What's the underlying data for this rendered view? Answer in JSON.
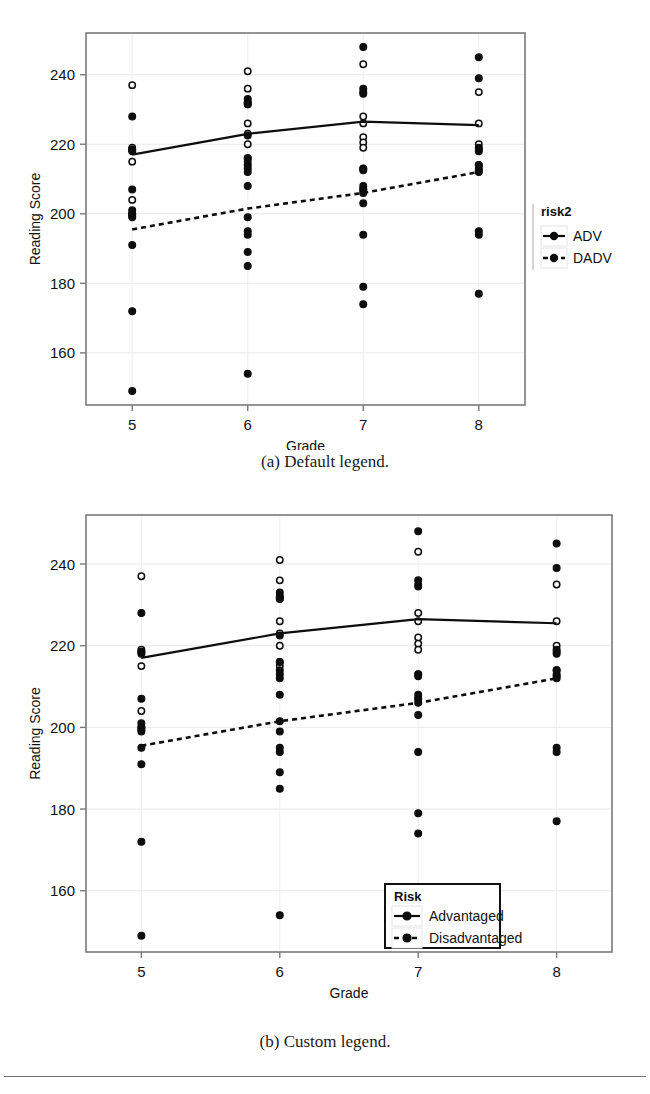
{
  "page": {
    "figure_a_caption": "(a) Default legend.",
    "figure_b_caption": "(b) Custom legend."
  },
  "chart_data": [
    {
      "id": "default-legend",
      "type": "scatter",
      "title": "",
      "xlabel": "Grade",
      "ylabel": "Reading Score",
      "xlim": [
        4.6,
        8.4
      ],
      "ylim": [
        145,
        252
      ],
      "xticks": [
        5,
        6,
        7,
        8
      ],
      "xticklabels": [
        "5",
        "6",
        "7",
        "8"
      ],
      "yticks": [
        160,
        180,
        200,
        220,
        240
      ],
      "yticklabels": [
        "160",
        "180",
        "200",
        "220",
        "240"
      ],
      "grid": true,
      "legend": {
        "title": "risk2",
        "position": "right",
        "boxed": false,
        "entries": [
          {
            "label": "ADV",
            "marker": "filled-circle",
            "line": "solid"
          },
          {
            "label": "DADV",
            "marker": "filled-circle",
            "line": "dotted"
          }
        ]
      },
      "series": [
        {
          "name": "ADV",
          "marker": "open-circle",
          "line": "solid",
          "trend": {
            "x": [
              5,
              6,
              7,
              8
            ],
            "y": [
              217.0,
              223.0,
              226.5,
              225.5
            ]
          },
          "points": {
            "5": [
              237,
              219,
              218.5,
              215,
              204,
              200
            ],
            "6": [
              241,
              236,
              232,
              231.5,
              226,
              223,
              220,
              216,
              215
            ],
            "7": [
              243,
              235,
              228,
              226,
              222,
              220.5,
              219,
              213,
              207
            ],
            "8": [
              235,
              226,
              220,
              218.5,
              214
            ]
          }
        },
        {
          "name": "DADV",
          "marker": "filled-circle",
          "line": "dotted",
          "trend": {
            "x": [
              5,
              6,
              7,
              8
            ],
            "y": [
              195.5,
              201.5,
              206.0,
              212.0
            ]
          },
          "points": {
            "5": [
              228,
              218.5,
              218,
              207,
              201,
              200,
              199.5,
              199,
              191,
              172,
              149
            ],
            "6": [
              233,
              232,
              231.5,
              222.5,
              216,
              214,
              213,
              212,
              208,
              199,
              195,
              194,
              189,
              185,
              154
            ],
            "7": [
              248,
              236,
              234.5,
              213,
              212.5,
              208,
              207,
              206,
              203,
              194,
              179,
              174
            ],
            "8": [
              245,
              239,
              219,
              218,
              214,
              213,
              212.5,
              212,
              195,
              194,
              177
            ]
          }
        }
      ]
    },
    {
      "id": "custom-legend",
      "type": "scatter",
      "title": "",
      "xlabel": "Grade",
      "ylabel": "Reading Score",
      "xlim": [
        4.6,
        8.4
      ],
      "ylim": [
        145,
        252
      ],
      "xticks": [
        5,
        6,
        7,
        8
      ],
      "xticklabels": [
        "5",
        "6",
        "7",
        "8"
      ],
      "yticks": [
        160,
        180,
        200,
        220,
        240
      ],
      "yticklabels": [
        "160",
        "180",
        "200",
        "220",
        "240"
      ],
      "grid": true,
      "legend": {
        "title": "Risk",
        "position": "inside-bottom-center",
        "boxed": true,
        "entries": [
          {
            "label": "Advantaged",
            "marker": "filled-circle",
            "line": "solid"
          },
          {
            "label": "Disadvantaged",
            "marker": "filled-circle",
            "line": "dotted"
          }
        ]
      },
      "series": [
        {
          "name": "Advantaged",
          "marker": "open-circle",
          "line": "solid",
          "trend": {
            "x": [
              5,
              6,
              7,
              8
            ],
            "y": [
              217.0,
              223.0,
              226.5,
              225.5
            ]
          },
          "points": {
            "5": [
              237,
              219,
              218.5,
              215,
              204,
              200
            ],
            "6": [
              241,
              236,
              232,
              231.5,
              226,
              223,
              220,
              216,
              215
            ],
            "7": [
              243,
              235,
              228,
              226,
              222,
              220.5,
              219,
              213,
              207
            ],
            "8": [
              235,
              226,
              220,
              218.5,
              214
            ]
          }
        },
        {
          "name": "Disadvantaged",
          "marker": "filled-circle",
          "line": "dotted",
          "trend": {
            "x": [
              5,
              6,
              7,
              8
            ],
            "y": [
              195.5,
              201.5,
              206.0,
              212.0
            ]
          },
          "points": {
            "5": [
              228,
              218.5,
              218,
              207,
              201,
              200,
              199.5,
              199,
              195,
              191,
              172,
              149
            ],
            "6": [
              233,
              232,
              231.5,
              222.5,
              216,
              214,
              213,
              212,
              208,
              201.5,
              199,
              195,
              194,
              189,
              185,
              154
            ],
            "7": [
              248,
              236,
              234.5,
              213,
              212.5,
              208,
              207,
              206,
              203,
              194,
              179,
              174
            ],
            "8": [
              245,
              239,
              219,
              218,
              214,
              213,
              212.5,
              212,
              195,
              194,
              177
            ]
          }
        }
      ]
    }
  ],
  "colors": {
    "ink": "#0d0d0d",
    "frame": "#7a7a7a",
    "grid": "#e9e9e9"
  }
}
